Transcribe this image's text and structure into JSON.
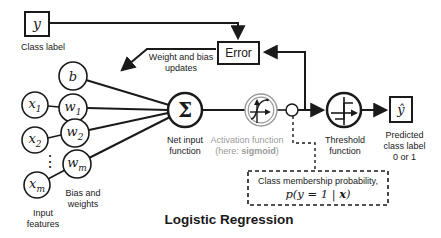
{
  "title": "Logistic Regression",
  "colors": {
    "ink": "#1a1a1a",
    "muted_gray": "#9a9a9a"
  },
  "top": {
    "class_label_value": "y",
    "class_label_caption": "Class label",
    "error_label": "Error",
    "feedback_caption": "Weight and bias\nupdates"
  },
  "inputs": {
    "bias": {
      "base": "b",
      "sub": ""
    },
    "x1": {
      "base": "x",
      "sub": "1"
    },
    "w1": {
      "base": "w",
      "sub": "1"
    },
    "x2": {
      "base": "x",
      "sub": "2"
    },
    "w2": {
      "base": "w",
      "sub": "2"
    },
    "xm": {
      "base": "x",
      "sub": "m"
    },
    "wm": {
      "base": "w",
      "sub": "m"
    },
    "dots": "⋮",
    "features_caption": "Input\nfeatures",
    "weights_caption": "Bias and\nweights"
  },
  "pipeline": {
    "sum_symbol": "Σ",
    "net_input_caption": "Net input\nfunction",
    "activation_caption_line1": "Activation function",
    "activation_caption_prefix": "(here: ",
    "activation_caption_bold": "sigmoid",
    "activation_caption_suffix": ")",
    "threshold_caption": "Threshold\nfunction",
    "output_symbol": "ŷ",
    "output_caption": "Predicted\nclass label\n0 or 1"
  },
  "probability_note": {
    "line1": "Class membership probability,",
    "math_prefix": "p(y = 1 | ",
    "math_x": "x",
    "math_suffix": ")"
  }
}
